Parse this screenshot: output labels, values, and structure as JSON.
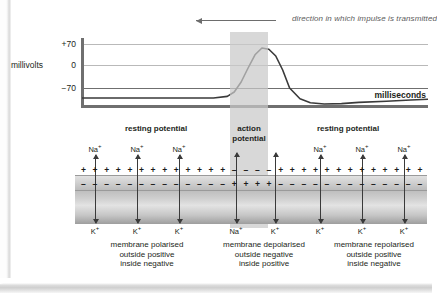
{
  "diagram": {
    "impulse": {
      "caption": "direction in which impulse is transmitted",
      "arrow_direction": "left",
      "arrow_icon": "left-arrow-icon"
    },
    "graph": {
      "y_axis_label": "millivolts",
      "x_axis_label": "milliseconds",
      "y_ticks": [
        "+70",
        "0",
        "−70"
      ],
      "phases": [
        {
          "label": "resting potential"
        },
        {
          "label": "action\npotential",
          "line1": "action",
          "line2": "potential"
        },
        {
          "label": "resting potential"
        }
      ]
    },
    "membrane": {
      "ions_above": [
        "Na",
        "Na",
        "Na",
        "Na",
        "Na",
        "Na"
      ],
      "ions_below": [
        "K",
        "K",
        "K",
        "Na",
        "K",
        "K",
        "K",
        "K"
      ],
      "ion_charge": "+",
      "captions": [
        {
          "line1": "membrane polarised",
          "line2": "outside positive",
          "line3": "inside negative"
        },
        {
          "line1": "membrane depolarised",
          "line2": "outside negative",
          "line3": "inside positive"
        },
        {
          "line1": "membrane repolarised",
          "line2": "outside positive",
          "line3": "inside negative"
        }
      ],
      "charge_positive": "+",
      "charge_negative": "–"
    },
    "colors": {
      "band": "#c9c9c9",
      "gridline": "#b9b9b9",
      "axis": "#6f6f6f",
      "curve": "#3a3a3a",
      "text": "#231f20",
      "caption_italic": "#5b5b5b"
    }
  },
  "chart_data": {
    "type": "line",
    "title": "",
    "xlabel": "milliseconds",
    "ylabel": "millivolts",
    "ylim": [
      -95,
      80
    ],
    "yticks": [
      70,
      0,
      -70
    ],
    "ytick_labels": [
      "+70",
      "0",
      "−70"
    ],
    "grid": true,
    "legend": "none",
    "annotations": [
      {
        "text": "direction in which impulse is transmitted",
        "position": "top-right"
      },
      {
        "text": "resting potential",
        "position": "below-axis-left"
      },
      {
        "text": "action potential",
        "position": "below-axis-center"
      },
      {
        "text": "resting potential",
        "position": "below-axis-right"
      }
    ],
    "shaded_region": {
      "label": "action potential",
      "x_start": 43,
      "x_end": 55
    },
    "series": [
      {
        "name": "membrane potential",
        "x": [
          0,
          10,
          20,
          30,
          38,
          42,
          44,
          46,
          48,
          50,
          52,
          54,
          56,
          58,
          60,
          63,
          66,
          70,
          75,
          80,
          88,
          95,
          100
        ],
        "values": [
          -70,
          -70,
          -70,
          -70,
          -70,
          -66,
          -55,
          -30,
          5,
          38,
          55,
          52,
          35,
          0,
          -45,
          -72,
          -82,
          -85,
          -84,
          -81,
          -78,
          -75,
          -73
        ]
      }
    ]
  }
}
